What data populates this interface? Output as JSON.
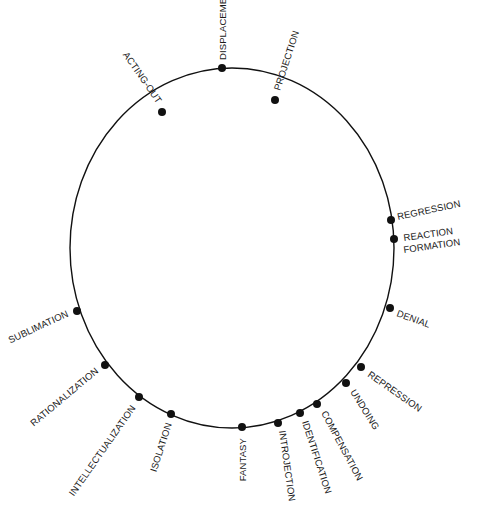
{
  "diagram": {
    "title": "",
    "circle": {
      "cx": 232,
      "cy": 248,
      "rx": 162,
      "ry": 180,
      "stroke": "#111111"
    },
    "nodes": [
      {
        "id": "acting-out",
        "label": "ACTING-OUT",
        "x": 162,
        "y": 112,
        "lx": 157,
        "ly": 104,
        "rot": 55,
        "anchor": "end"
      },
      {
        "id": "displacement",
        "label": "DISPLACEMENT",
        "x": 222,
        "y": 68,
        "lx": 226,
        "ly": 60,
        "rot": -90,
        "anchor": "start"
      },
      {
        "id": "projection",
        "label": "PROJECTION",
        "x": 275,
        "y": 100,
        "lx": 280,
        "ly": 91,
        "rot": -72,
        "anchor": "start"
      },
      {
        "id": "regression",
        "label": "REGRESSION",
        "x": 391,
        "y": 220,
        "lx": 398,
        "ly": 220,
        "rot": -12,
        "anchor": "start"
      },
      {
        "id": "reaction-formation-1",
        "label": "REACTION",
        "x": 394,
        "y": 239,
        "lx": 404,
        "ly": 241,
        "rot": -8,
        "anchor": "start"
      },
      {
        "id": "denial",
        "label": "DENIAL",
        "x": 390,
        "y": 308,
        "lx": 396,
        "ly": 316,
        "rot": 20,
        "anchor": "start"
      },
      {
        "id": "repression",
        "label": "REPRESSION",
        "x": 361,
        "y": 367,
        "lx": 367,
        "ly": 376,
        "rot": 35,
        "anchor": "start"
      },
      {
        "id": "undoing",
        "label": "UNDOING",
        "x": 346,
        "y": 383,
        "lx": 350,
        "ly": 392,
        "rot": 58,
        "anchor": "start"
      },
      {
        "id": "compensation",
        "label": "COMPENSATION",
        "x": 317,
        "y": 404,
        "lx": 321,
        "ly": 413,
        "rot": 62,
        "anchor": "start"
      },
      {
        "id": "identification",
        "label": "IDENTIFICATION",
        "x": 300,
        "y": 413,
        "lx": 302,
        "ly": 422,
        "rot": 72,
        "anchor": "start"
      },
      {
        "id": "introjection",
        "label": "INTROJECTION",
        "x": 278,
        "y": 423,
        "lx": 279,
        "ly": 431,
        "rot": 82,
        "anchor": "start"
      },
      {
        "id": "fantasy",
        "label": "FANTASY",
        "x": 242,
        "y": 427,
        "lx": 246,
        "ly": 438,
        "rot": -90,
        "anchor": "end"
      },
      {
        "id": "isolation",
        "label": "ISOLATION",
        "x": 171,
        "y": 414,
        "lx": 172,
        "ly": 424,
        "rot": -72,
        "anchor": "end"
      },
      {
        "id": "intellectualization",
        "label": "INTELLECTUALIZATION",
        "x": 139,
        "y": 397,
        "lx": 136,
        "ly": 408,
        "rot": -55,
        "anchor": "end"
      },
      {
        "id": "rationalization",
        "label": "RATIONALIZATION",
        "x": 105,
        "y": 365,
        "lx": 99,
        "ly": 372,
        "rot": -40,
        "anchor": "end"
      },
      {
        "id": "sublimation",
        "label": "SUBLIMATION",
        "x": 77,
        "y": 311,
        "lx": 69,
        "ly": 316,
        "rot": -25,
        "anchor": "end"
      }
    ],
    "extra_labels": [
      {
        "id": "reaction-formation-2",
        "label": "FORMATION",
        "lx": 404,
        "ly": 253,
        "rot": -8,
        "anchor": "start"
      }
    ]
  }
}
